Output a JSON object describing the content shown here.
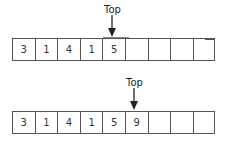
{
  "diagram": {
    "before": {
      "cells": [
        "3",
        "1",
        "4",
        "1",
        "5",
        "",
        "",
        "",
        ""
      ],
      "top_label": "Top",
      "top_index": 4
    },
    "after": {
      "cells": [
        "3",
        "1",
        "4",
        "1",
        "5",
        "9",
        "",
        "",
        ""
      ],
      "top_label": "Top",
      "top_index": 5
    },
    "colors": {
      "border": "#555555",
      "text": "#333333",
      "background": "#ffffff"
    }
  }
}
